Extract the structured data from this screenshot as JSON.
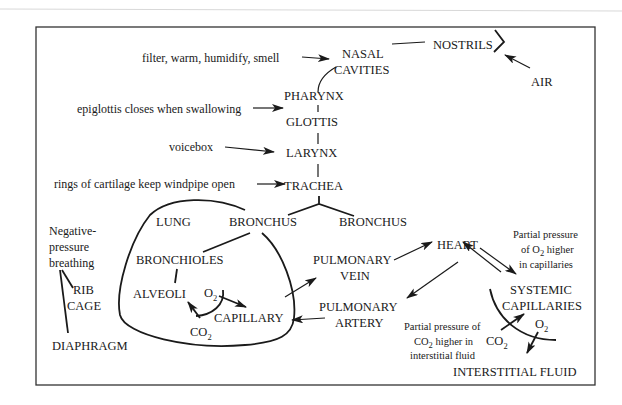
{
  "diagram": {
    "airway": {
      "air": "AIR",
      "nostrils": "NOSTRILS",
      "nasal_cavities": [
        "NASAL",
        "CAVITIES"
      ],
      "pharynx": "PHARYNX",
      "glottis": "GLOTTIS",
      "larynx": "LARYNX",
      "trachea": "TRACHEA",
      "bronchus_left": "BRONCHUS",
      "bronchus_right": "BRONCHUS"
    },
    "annotations": {
      "nasal": "filter, warm, humidify, smell",
      "pharynx": "epiglottis closes when swallowing",
      "larynx": "voicebox",
      "trachea": "rings of cartilage keep windpipe open"
    },
    "breathing": {
      "label": [
        "Negative-",
        "pressure",
        "breathing"
      ],
      "rib_cage": [
        "RIB",
        "CAGE"
      ],
      "diaphragm": "DIAPHRAGM"
    },
    "lung": {
      "label": "LUNG",
      "bronchioles": "BRONCHIOLES",
      "alveoli": "ALVEOLI",
      "capillary": "CAPILLARY",
      "o2": "O",
      "o2_sub": "2",
      "co2": "CO",
      "co2_sub": "2"
    },
    "circulation": {
      "pulmonary_vein": [
        "PULMONARY",
        "VEIN"
      ],
      "pulmonary_artery": [
        "PULMONARY",
        "ARTERY"
      ],
      "heart": "HEART",
      "systemic_capillaries": [
        "SYSTEMIC",
        "CAPILLARIES"
      ],
      "interstitial_fluid": "INTERSTITIAL FLUID",
      "o2": "O",
      "o2_sub": "2",
      "co2": "CO",
      "co2_sub": "2"
    },
    "notes": {
      "o2_note": {
        "line1": "Partial pressure",
        "line2_pre": "of O",
        "line2_sub": "2",
        "line2_post": " higher",
        "line3": "in capillaries"
      },
      "co2_note": {
        "line1": "Partial pressure of",
        "line2_pre": "CO",
        "line2_sub": "2",
        "line2_post": " higher in",
        "line3": "interstitial fluid"
      }
    }
  }
}
